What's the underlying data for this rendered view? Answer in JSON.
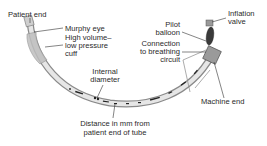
{
  "diagram": {
    "labels": {
      "patient_end": "Patient end",
      "murphy_eye": "Murphy eye",
      "cuff_line1": "High volume–",
      "cuff_line2": "low pressure",
      "cuff_line3": "cuff",
      "internal_diameter_line1": "Internal",
      "internal_diameter_line2": "diameter",
      "distance_line1": "Distance in mm from",
      "distance_line2": "patient end of tube",
      "pilot_line1": "Pilot",
      "pilot_line2": "balloon",
      "connection_line1": "Connection",
      "connection_line2": "to breathing",
      "connection_line3": "circuit",
      "inflation_line1": "Inflation",
      "inflation_line2": "valve",
      "machine_end": "Machine end"
    },
    "colors": {
      "tube": "#d9d9d9",
      "tube_edge": "#8a8a8a",
      "text": "#2a2a2a",
      "leader": "#333333"
    }
  }
}
